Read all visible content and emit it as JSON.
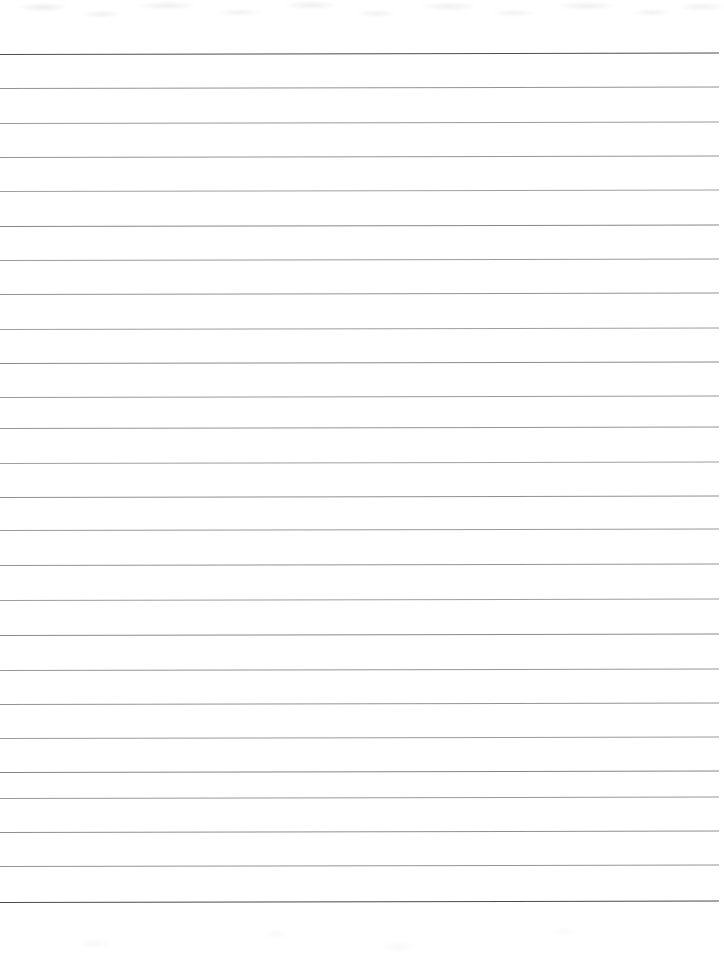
{
  "document": {
    "type": "scanned-lined-paper",
    "title": "Blank ruled notebook page",
    "text_content": "",
    "page_width": 724,
    "page_height": 963,
    "background_color": "#ffffff",
    "orientation": "portrait"
  },
  "ruling": {
    "style": "wide-ruled horizontal lines",
    "line_count": 26,
    "first_line_y": 54,
    "last_line_y": 902,
    "spacing_px": 34.3,
    "line_left_x": 0,
    "line_right_x": 718,
    "default_color": "#8f8f96",
    "emphasis_color": "#56565c",
    "line_thickness_px": 1,
    "skew_degrees": -0.12,
    "top_margin_px": 54,
    "bottom_margin_px": 61,
    "right_margin_px": 6,
    "left_margin_px": 0
  },
  "lines": [
    {
      "index": 1,
      "y": 54,
      "color": "#4e4e54",
      "opacity": 1.0,
      "left": 0,
      "width": 719
    },
    {
      "index": 2,
      "y": 88,
      "color": "#8a8a92",
      "opacity": 0.92,
      "left": 0,
      "width": 719
    },
    {
      "index": 3,
      "y": 123,
      "color": "#8f8f97",
      "opacity": 0.9,
      "left": 0,
      "width": 719
    },
    {
      "index": 4,
      "y": 157,
      "color": "#8c8c94",
      "opacity": 0.92,
      "left": 0,
      "width": 719
    },
    {
      "index": 5,
      "y": 191,
      "color": "#93939a",
      "opacity": 0.88,
      "left": 0,
      "width": 719
    },
    {
      "index": 6,
      "y": 226,
      "color": "#7f7f88",
      "opacity": 0.95,
      "left": 0,
      "width": 719
    },
    {
      "index": 7,
      "y": 260,
      "color": "#8d8d95",
      "opacity": 0.9,
      "left": 0,
      "width": 719
    },
    {
      "index": 8,
      "y": 294,
      "color": "#8a8a92",
      "opacity": 0.92,
      "left": 0,
      "width": 719
    },
    {
      "index": 9,
      "y": 329,
      "color": "#909098",
      "opacity": 0.88,
      "left": 0,
      "width": 719
    },
    {
      "index": 10,
      "y": 363,
      "color": "#84848d",
      "opacity": 0.94,
      "left": 0,
      "width": 719
    },
    {
      "index": 11,
      "y": 397,
      "color": "#8e8e96",
      "opacity": 0.9,
      "left": 0,
      "width": 719
    },
    {
      "index": 12,
      "y": 428,
      "color": "#8b8b93",
      "opacity": 0.92,
      "left": 0,
      "width": 719
    },
    {
      "index": 13,
      "y": 463,
      "color": "#919199",
      "opacity": 0.88,
      "left": 0,
      "width": 719
    },
    {
      "index": 14,
      "y": 497,
      "color": "#86868f",
      "opacity": 0.93,
      "left": 0,
      "width": 719
    },
    {
      "index": 15,
      "y": 530,
      "color": "#8d8d95",
      "opacity": 0.9,
      "left": 0,
      "width": 719
    },
    {
      "index": 16,
      "y": 565,
      "color": "#8a8a92",
      "opacity": 0.92,
      "left": 0,
      "width": 719
    },
    {
      "index": 17,
      "y": 600,
      "color": "#909098",
      "opacity": 0.88,
      "left": 0,
      "width": 719
    },
    {
      "index": 18,
      "y": 635,
      "color": "#83838c",
      "opacity": 0.94,
      "left": 0,
      "width": 719
    },
    {
      "index": 19,
      "y": 670,
      "color": "#8c8c94",
      "opacity": 0.91,
      "left": 0,
      "width": 719
    },
    {
      "index": 20,
      "y": 704,
      "color": "#8a8a92",
      "opacity": 0.92,
      "left": 0,
      "width": 719
    },
    {
      "index": 21,
      "y": 738,
      "color": "#8f8f97",
      "opacity": 0.89,
      "left": 0,
      "width": 719
    },
    {
      "index": 22,
      "y": 772,
      "color": "#7e7e87",
      "opacity": 0.95,
      "left": 0,
      "width": 719
    },
    {
      "index": 23,
      "y": 798,
      "color": "#8d8d95",
      "opacity": 0.9,
      "left": 0,
      "width": 719
    },
    {
      "index": 24,
      "y": 832,
      "color": "#87878f",
      "opacity": 0.93,
      "left": 0,
      "width": 719
    },
    {
      "index": 25,
      "y": 866,
      "color": "#8b8b93",
      "opacity": 0.92,
      "left": 0,
      "width": 719
    },
    {
      "index": 26,
      "y": 902,
      "color": "#4a4a50",
      "opacity": 1.0,
      "left": 0,
      "width": 719
    }
  ],
  "annotations": {
    "handwriting_present": false,
    "margin_rule_present": false,
    "hole_punches_present": false,
    "scan_noise_top": true,
    "scan_noise_bottom": true
  }
}
